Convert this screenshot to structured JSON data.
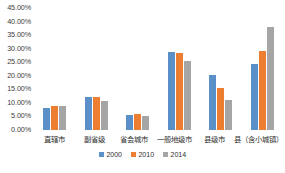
{
  "chart_data": {
    "type": "bar",
    "title": "",
    "subtitle": "",
    "xlabel": "",
    "ylabel": "",
    "ylim": [
      0,
      45
    ],
    "y_tick_labels": [
      "45.00%",
      "40.00%",
      "35.00%",
      "30.00%",
      "25.00%",
      "20.00%",
      "15.00%",
      "10.00%",
      "5.00%",
      "0.00%"
    ],
    "y_tick_values": [
      45,
      40,
      35,
      30,
      25,
      20,
      15,
      10,
      5,
      0
    ],
    "value_format": "percent",
    "grid": false,
    "legend_position": "bottom",
    "categories": [
      "直辖市",
      "副省级",
      "省会城市",
      "一般地级市",
      "县级市",
      "县（含小城镇）"
    ],
    "series": [
      {
        "name": "2000",
        "color": "#5b8fc7",
        "values": [
          8.0,
          12.3,
          5.4,
          28.8,
          20.4,
          24.4
        ]
      },
      {
        "name": "2010",
        "color": "#ed7d31",
        "values": [
          8.8,
          12.2,
          5.9,
          28.3,
          15.4,
          29.2
        ]
      },
      {
        "name": "2014",
        "color": "#a5a5a5",
        "values": [
          9.0,
          10.8,
          5.3,
          25.4,
          10.9,
          38.0
        ]
      }
    ]
  }
}
